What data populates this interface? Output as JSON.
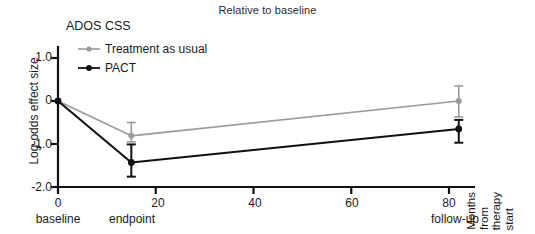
{
  "chart_data": {
    "type": "line",
    "title": "Relative to baseline",
    "panel_label": "ADOS CSS",
    "xlabel": "Months from therapy start",
    "xlabel_lines": [
      "Months",
      "from",
      "therapy",
      "start"
    ],
    "ylabel": "Log-odds effect size",
    "xlim": [
      0,
      88
    ],
    "ylim": [
      -2.0,
      1.3
    ],
    "xticks": [
      0,
      20,
      40,
      60,
      80
    ],
    "xtick_labels": [
      "0",
      "20",
      "40",
      "60",
      "80"
    ],
    "yticks": [
      1.0,
      0,
      -1.0,
      -2.0
    ],
    "ytick_labels": [
      "1.0",
      "0",
      "-1.0",
      "-2.0"
    ],
    "x_sub_labels": [
      {
        "x": 0,
        "label": "baseline"
      },
      {
        "x": 15,
        "label": "endpoint"
      },
      {
        "x": 82,
        "label": "follow-up"
      }
    ],
    "grid": false,
    "legend_position": "top-left-inside",
    "series": [
      {
        "name": "Treatment as usual",
        "color": "#9b9b9b",
        "x": [
          0,
          15,
          82
        ],
        "values": [
          0.0,
          -0.81,
          0.0
        ],
        "err_low": [
          0.0,
          -0.95,
          -0.37
        ],
        "err_high": [
          0.0,
          -0.5,
          0.35
        ]
      },
      {
        "name": "PACT",
        "color": "#111111",
        "x": [
          0,
          15,
          82
        ],
        "values": [
          0.0,
          -1.43,
          -0.65
        ],
        "err_low": [
          0.0,
          -1.76,
          -0.97
        ],
        "err_high": [
          0.0,
          -1.01,
          -0.44
        ]
      }
    ]
  }
}
